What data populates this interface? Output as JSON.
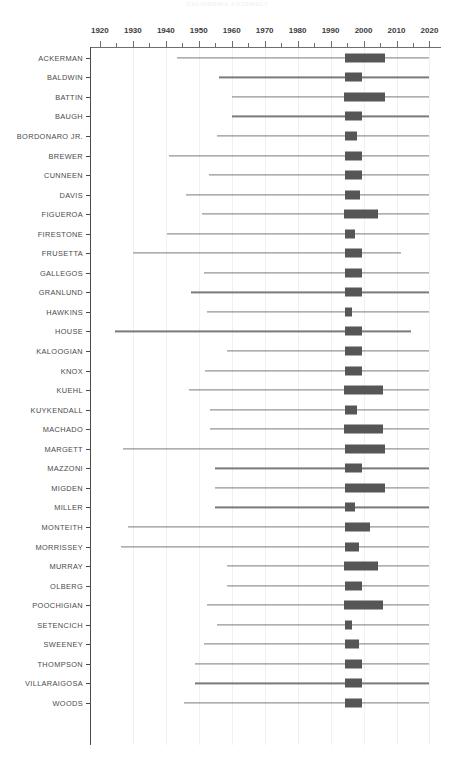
{
  "chart_data": {
    "type": "bar",
    "title": "CALIFORNIA ASSEMBLY",
    "xlabel": "",
    "ylabel": "",
    "xlim": [
      1917,
      2023.5
    ],
    "grid": true,
    "legend_position": "none",
    "tick_labels": [
      "1920",
      "1930",
      "1940",
      "1950",
      "1960",
      "1970",
      "1980",
      "1990",
      "2000",
      "2010",
      "2020"
    ],
    "tick_values": [
      1920,
      1930,
      1940,
      1950,
      1960,
      1970,
      1980,
      1990,
      2000,
      2010,
      2020
    ],
    "minor_tick_values": [
      1925,
      1935,
      1945,
      1955,
      1965,
      1975,
      1985,
      1995,
      2005,
      2015
    ],
    "gridline_values": [
      1930,
      1940,
      1950,
      1960,
      1970,
      1980,
      1990,
      2000,
      2010,
      2020
    ],
    "categories": [
      "ACKERMAN",
      "BALDWIN",
      "BATTIN",
      "BAUGH",
      "BORDONARO JR.",
      "BREWER",
      "CUNNEEN",
      "DAVIS",
      "FIGUEROA",
      "FIRESTONE",
      "FRUSETTA",
      "GALLEGOS",
      "GRANLUND",
      "HAWKINS",
      "HOUSE",
      "KALOOGIAN",
      "KNOX",
      "KUEHL",
      "KUYKENDALL",
      "MACHADO",
      "MARGETT",
      "MAZZONI",
      "MIGDEN",
      "MILLER",
      "MONTEITH",
      "MORRISSEY",
      "MURRAY",
      "OLBERG",
      "POOCHIGIAN",
      "SETENCICH",
      "SWEENEY",
      "THOMPSON",
      "VILLARAIGOSA",
      "WOODS"
    ],
    "series_note": "Each row is a horizontal range with a thin whisker line (min to max) and a thick box (interquartile range).",
    "rows": [
      {
        "name": "ACKERMAN",
        "whisker_min": 1943.5,
        "whisker_max": 2020.0,
        "box_start": 1994.5,
        "box_end": 2006.5
      },
      {
        "name": "BALDWIN",
        "whisker_min": 1956.0,
        "whisker_max": 2020.0,
        "box_start": 1994.5,
        "box_end": 1999.5
      },
      {
        "name": "BATTIN",
        "whisker_min": 1960.0,
        "whisker_max": 2020.0,
        "box_start": 1994.0,
        "box_end": 2006.5
      },
      {
        "name": "BAUGH",
        "whisker_min": 1960.0,
        "whisker_max": 2020.0,
        "box_start": 1994.5,
        "box_end": 1999.5
      },
      {
        "name": "BORDONARO JR.",
        "whisker_min": 1955.5,
        "whisker_max": 2020.0,
        "box_start": 1994.5,
        "box_end": 1998.0
      },
      {
        "name": "BREWER",
        "whisker_min": 1941.0,
        "whisker_max": 2020.0,
        "box_start": 1994.5,
        "box_end": 1999.5
      },
      {
        "name": "CUNNEEN",
        "whisker_min": 1953.0,
        "whisker_max": 2020.0,
        "box_start": 1994.5,
        "box_end": 1999.5
      },
      {
        "name": "DAVIS",
        "whisker_min": 1946.0,
        "whisker_max": 2020.0,
        "box_start": 1994.5,
        "box_end": 1999.0
      },
      {
        "name": "FIGUEROA",
        "whisker_min": 1951.0,
        "whisker_max": 2020.0,
        "box_start": 1994.0,
        "box_end": 2004.5
      },
      {
        "name": "FIRESTONE",
        "whisker_min": 1940.5,
        "whisker_max": 2020.0,
        "box_start": 1994.5,
        "box_end": 1997.5
      },
      {
        "name": "FRUSETTA",
        "whisker_min": 1930.0,
        "whisker_max": 2011.5,
        "box_start": 1994.5,
        "box_end": 1999.5
      },
      {
        "name": "GALLEGOS",
        "whisker_min": 1951.5,
        "whisker_max": 2020.0,
        "box_start": 1994.5,
        "box_end": 1999.5
      },
      {
        "name": "GRANLUND",
        "whisker_min": 1947.5,
        "whisker_max": 2020.0,
        "box_start": 1994.5,
        "box_end": 1999.5
      },
      {
        "name": "HAWKINS",
        "whisker_min": 1952.5,
        "whisker_max": 2020.0,
        "box_start": 1994.5,
        "box_end": 1996.5
      },
      {
        "name": "HOUSE",
        "whisker_min": 1924.5,
        "whisker_max": 2014.5,
        "box_start": 1994.5,
        "box_end": 1999.5
      },
      {
        "name": "KALOOGIAN",
        "whisker_min": 1958.5,
        "whisker_max": 2020.0,
        "box_start": 1994.5,
        "box_end": 1999.5
      },
      {
        "name": "KNOX",
        "whisker_min": 1952.0,
        "whisker_max": 2020.0,
        "box_start": 1994.5,
        "box_end": 1999.5
      },
      {
        "name": "KUEHL",
        "whisker_min": 1947.0,
        "whisker_max": 2020.0,
        "box_start": 1994.0,
        "box_end": 2006.0
      },
      {
        "name": "KUYKENDALL",
        "whisker_min": 1953.5,
        "whisker_max": 2020.0,
        "box_start": 1994.5,
        "box_end": 1998.0
      },
      {
        "name": "MACHADO",
        "whisker_min": 1953.5,
        "whisker_max": 2020.0,
        "box_start": 1994.0,
        "box_end": 2006.0
      },
      {
        "name": "MARGETT",
        "whisker_min": 1927.0,
        "whisker_max": 2020.0,
        "box_start": 1994.5,
        "box_end": 2006.5
      },
      {
        "name": "MAZZONI",
        "whisker_min": 1955.0,
        "whisker_max": 2020.0,
        "box_start": 1994.5,
        "box_end": 1999.5
      },
      {
        "name": "MIGDEN",
        "whisker_min": 1955.0,
        "whisker_max": 2020.0,
        "box_start": 1994.5,
        "box_end": 2006.5
      },
      {
        "name": "MILLER",
        "whisker_min": 1955.0,
        "whisker_max": 2020.0,
        "box_start": 1994.5,
        "box_end": 1997.5
      },
      {
        "name": "MONTEITH",
        "whisker_min": 1928.5,
        "whisker_max": 2020.0,
        "box_start": 1994.5,
        "box_end": 2002.0
      },
      {
        "name": "MORRISSEY",
        "whisker_min": 1926.5,
        "whisker_max": 2020.0,
        "box_start": 1994.5,
        "box_end": 1998.5
      },
      {
        "name": "MURRAY",
        "whisker_min": 1958.5,
        "whisker_max": 2020.0,
        "box_start": 1994.0,
        "box_end": 2004.5
      },
      {
        "name": "OLBERG",
        "whisker_min": 1958.5,
        "whisker_max": 2020.0,
        "box_start": 1994.5,
        "box_end": 1999.5
      },
      {
        "name": "POOCHIGIAN",
        "whisker_min": 1952.5,
        "whisker_max": 2020.0,
        "box_start": 1994.0,
        "box_end": 2006.0
      },
      {
        "name": "SETENCICH",
        "whisker_min": 1955.5,
        "whisker_max": 2020.0,
        "box_start": 1994.5,
        "box_end": 1996.5
      },
      {
        "name": "SWEENEY",
        "whisker_min": 1951.5,
        "whisker_max": 2020.0,
        "box_start": 1994.5,
        "box_end": 1998.5
      },
      {
        "name": "THOMPSON",
        "whisker_min": 1949.0,
        "whisker_max": 2020.0,
        "box_start": 1994.5,
        "box_end": 1999.5
      },
      {
        "name": "VILLARAIGOSA",
        "whisker_min": 1949.0,
        "whisker_max": 2020.0,
        "box_start": 1994.5,
        "box_end": 1999.5
      },
      {
        "name": "WOODS",
        "whisker_min": 1945.5,
        "whisker_max": 2020.0,
        "box_start": 1994.5,
        "box_end": 1999.5
      }
    ]
  }
}
